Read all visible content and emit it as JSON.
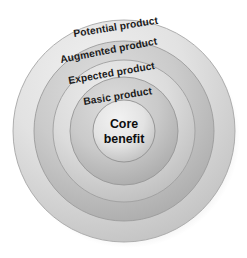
{
  "diagram": {
    "background_color": "#ffffff",
    "center": {
      "x": 124,
      "y": 131
    },
    "core": {
      "name": "core-benefit",
      "line1": "Core",
      "line2": "benefit",
      "radius": 31,
      "fill_light": "#e9e9e9",
      "fill_dark": "#bdbdbd",
      "stroke": "#8f8f8f"
    },
    "rings": [
      {
        "id": "potential-product",
        "label": "Potential product",
        "radius": 111,
        "fill_light": "#e4e4e4",
        "fill_dark": "#c2c2c2",
        "stroke": "#a2a2a2",
        "label_rotation": -9,
        "label_x": 74,
        "label_y": 37
      },
      {
        "id": "augmented-product",
        "label": "Augmented product",
        "radius": 90,
        "fill_light": "#d6d6d6",
        "fill_dark": "#b0b0b0",
        "stroke": "#9a9a9a",
        "label_rotation": -10,
        "label_x": 62,
        "label_y": 62
      },
      {
        "id": "expected-product",
        "label": "Expected product",
        "radius": 71,
        "fill_light": "#e2e2e2",
        "fill_dark": "#bfbfbf",
        "stroke": "#9d9d9d",
        "label_rotation": -9,
        "label_x": 70,
        "label_y": 83
      },
      {
        "id": "basic-product",
        "label": "Basic product",
        "radius": 54,
        "fill_light": "#d4d4d4",
        "fill_dark": "#afafaf",
        "stroke": "#959595",
        "label_rotation": -9,
        "label_x": 84,
        "label_y": 104
      }
    ],
    "colors": {
      "background": "#ffffff",
      "text": "#1b1b1b",
      "outline": "#9a9a9a",
      "shadow": "#cfcfcf"
    }
  }
}
